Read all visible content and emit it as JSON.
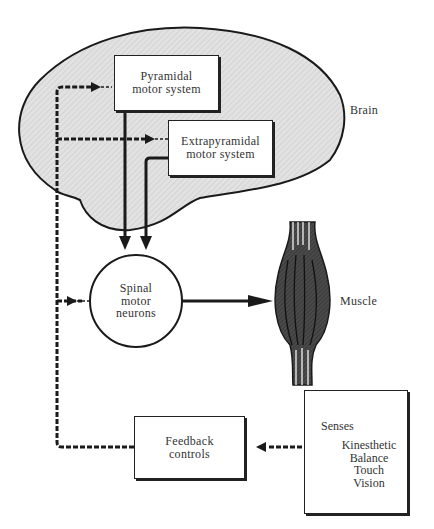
{
  "diagram": {
    "regions": {
      "brain_label": "Brain",
      "muscle_label": "Muscle"
    },
    "nodes": {
      "pyramidal": [
        "Pyramidal",
        "motor system"
      ],
      "extrapyramidal": [
        "Extrapyramidal",
        "motor system"
      ],
      "spinal": [
        "Spinal",
        "motor",
        "neurons"
      ],
      "feedback": [
        "Feedback",
        "controls"
      ],
      "senses": {
        "title": "Senses",
        "items": [
          "Kinesthetic",
          "Balance",
          "Touch",
          "Vision"
        ]
      }
    },
    "edges": [
      {
        "from": "Pyramidal motor system",
        "to": "Spinal motor neurons",
        "style": "solid"
      },
      {
        "from": "Extrapyramidal motor system",
        "to": "Spinal motor neurons",
        "style": "solid"
      },
      {
        "from": "Spinal motor neurons",
        "to": "Muscle",
        "style": "solid"
      },
      {
        "from": "Senses",
        "to": "Feedback controls",
        "style": "dashed"
      },
      {
        "from": "Feedback controls",
        "to": "Pyramidal motor system",
        "style": "dashed"
      },
      {
        "from": "Feedback controls",
        "to": "Extrapyramidal motor system",
        "style": "dashed"
      },
      {
        "from": "Feedback controls",
        "to": "Spinal motor neurons",
        "style": "dashed"
      }
    ],
    "colors": {
      "brain_fill": "#dcdcdc",
      "line": "#1a1a1a",
      "muscle": "#3a3a3a"
    }
  }
}
